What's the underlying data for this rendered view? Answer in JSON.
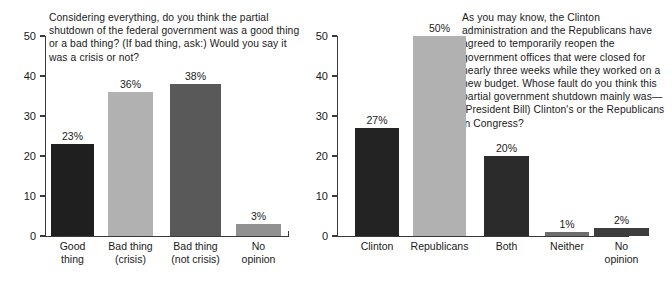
{
  "figure": {
    "background": "#ffffff",
    "axis_color": "#3a3a3a",
    "text_color": "#1a1a1a"
  },
  "chart_data": [
    {
      "type": "bar",
      "panel": "left",
      "title": "Considering everything, do you think the partial shutdown of the federal government was a good thing or a bad thing? (If bad thing, ask:) Would you say it was a crisis or not?",
      "xlabel": "",
      "ylabel": "",
      "ylim": [
        0,
        50
      ],
      "yticks": [
        0,
        10,
        20,
        30,
        40,
        50
      ],
      "ytick_labels": [
        "0",
        "10",
        "20",
        "30",
        "40",
        "50"
      ],
      "grid": false,
      "legend": "none",
      "categories": [
        "Good\nthing",
        "Bad thing\n(crisis)",
        "Bad thing\n(not crisis)",
        "No\nopinion"
      ],
      "values": [
        23,
        36,
        38,
        3
      ],
      "value_labels": [
        "23%",
        "36%",
        "38%",
        "3%"
      ],
      "bar_colors": [
        "#1f1f1f",
        "#b1b1b1",
        "#595959",
        "#919191"
      ]
    },
    {
      "type": "bar",
      "panel": "right",
      "title": "As you may know, the Clinton administration and the Republicans have agreed to temporarily reopen the government offices that were closed for nearly three weeks while they worked on a new budget. Whose fault do you think this partial government shutdown mainly was—(President Bill) Clinton's or the Republicans in Congress?",
      "xlabel": "",
      "ylabel": "",
      "ylim": [
        0,
        50
      ],
      "yticks": [
        0,
        10,
        20,
        30,
        40,
        50
      ],
      "ytick_labels": [
        "0",
        "10",
        "20",
        "30",
        "40",
        "50"
      ],
      "grid": false,
      "legend": "none",
      "categories": [
        "Clinton",
        "Republicans",
        "Both",
        "Neither",
        "No\nopinion"
      ],
      "values": [
        27,
        50,
        20,
        1,
        2
      ],
      "value_labels": [
        "27%",
        "50%",
        "20%",
        "1%",
        "2%"
      ],
      "bar_colors": [
        "#232323",
        "#b1b1b1",
        "#2b2b2b",
        "#6e6e6e",
        "#3d3d3d"
      ]
    }
  ]
}
